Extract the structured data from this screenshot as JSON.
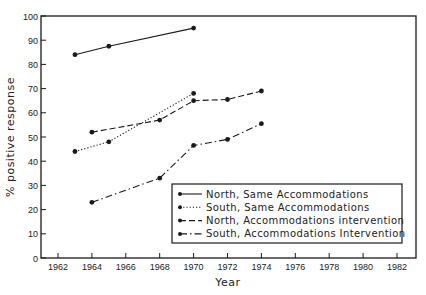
{
  "chart_data": {
    "type": "line",
    "title": "",
    "xlabel": "Year",
    "ylabel": "% positive response",
    "xlim": [
      1961,
      1983
    ],
    "ylim": [
      0,
      100
    ],
    "xticks": [
      1962,
      1964,
      1966,
      1968,
      1970,
      1972,
      1974,
      1976,
      1978,
      1980,
      1982
    ],
    "yticks": [
      0,
      10,
      20,
      30,
      40,
      50,
      60,
      70,
      80,
      90,
      100
    ],
    "grid": false,
    "legend_position": "lower right",
    "series": [
      {
        "name": "North, Same Accommodations",
        "style": "solid",
        "x": [
          1963,
          1965,
          1970
        ],
        "values": [
          84,
          87.5,
          95
        ]
      },
      {
        "name": "South, Same Accommodations",
        "style": "dotted",
        "x": [
          1963,
          1965,
          1970
        ],
        "values": [
          44,
          48,
          68
        ]
      },
      {
        "name": "North, Accommodations intervention",
        "style": "dashed",
        "x": [
          1964,
          1968,
          1970,
          1972,
          1974
        ],
        "values": [
          52,
          57,
          65,
          65.5,
          69
        ]
      },
      {
        "name": "South, Accommodations Intervention",
        "style": "dashdot",
        "x": [
          1964,
          1968,
          1970,
          1972,
          1974
        ],
        "values": [
          23,
          33,
          46.5,
          49,
          55.5
        ]
      }
    ]
  },
  "colors": {
    "ink": "#1a1a1a",
    "background": "#ffffff"
  }
}
